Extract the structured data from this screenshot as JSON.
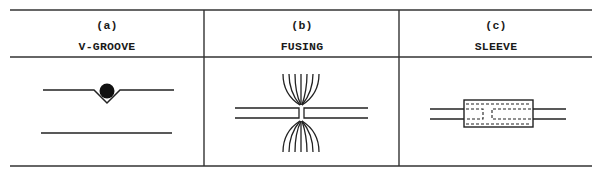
{
  "figure": {
    "line_color": "#2b2b2b",
    "columns": [
      {
        "letter": "(a)",
        "title": "V-GROOVE",
        "diagram": "v-groove"
      },
      {
        "letter": "(b)",
        "title": "FUSING",
        "diagram": "fusing"
      },
      {
        "letter": "(c)",
        "title": "SLEEVE",
        "diagram": "sleeve"
      }
    ]
  }
}
